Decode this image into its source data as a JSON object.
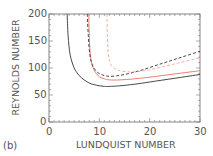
{
  "chart_data": {
    "type": "line",
    "title": "",
    "panel_label": "(b)",
    "xlabel": "LUNDQUIST NUMBER",
    "ylabel": "REYNOLDS NUMBER",
    "xlim": [
      0,
      30
    ],
    "ylim": [
      0,
      200
    ],
    "xticks": [
      "0",
      "10",
      "20",
      "30"
    ],
    "yticks": [
      "0",
      "50",
      "100",
      "150",
      "200"
    ],
    "grid": false,
    "legend": null,
    "series": [
      {
        "name": "black-solid",
        "color": "#333333",
        "style": "solid",
        "x": [
          3.6,
          3.8,
          4.2,
          5,
          6,
          7,
          8,
          9,
          10,
          11,
          12,
          14,
          17,
          20,
          25,
          30
        ],
        "y": [
          200,
          160,
          125,
          100,
          86,
          78,
          72,
          69,
          67,
          66,
          66,
          67,
          70,
          74,
          81,
          88
        ]
      },
      {
        "name": "red-solid",
        "color": "#e8735a",
        "style": "solid",
        "x": [
          7.9,
          8.0,
          8.2,
          8.6,
          9.2,
          10,
          11,
          12,
          14,
          17,
          20,
          25,
          30
        ],
        "y": [
          200,
          160,
          125,
          105,
          92,
          84,
          80,
          78,
          78,
          80,
          83,
          89,
          95
        ]
      },
      {
        "name": "black-dashed",
        "color": "#333333",
        "style": "dashed",
        "x": [
          7.6,
          7.8,
          8.1,
          8.6,
          9.4,
          10.4,
          11.5,
          13,
          15,
          18,
          22,
          26,
          30
        ],
        "y": [
          200,
          160,
          125,
          106,
          94,
          88,
          85,
          85,
          88,
          95,
          107,
          119,
          131
        ]
      },
      {
        "name": "pink-dashed",
        "color": "#f2a59a",
        "style": "dashed",
        "x": [
          11.5,
          11.6,
          11.8,
          12.2,
          13,
          14,
          15.5,
          17,
          19,
          22,
          26,
          30
        ],
        "y": [
          200,
          160,
          125,
          108,
          99,
          95,
          93,
          93,
          95,
          101,
          110,
          119
        ]
      }
    ]
  }
}
